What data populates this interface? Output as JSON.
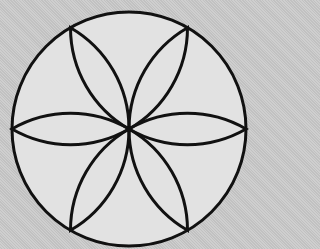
{
  "diagram": {
    "type": "six-petal rosette inscribed in circle",
    "canvas": {
      "width": 259,
      "height": 249
    },
    "circle": {
      "cx": 129,
      "cy": 129,
      "r": 117
    },
    "petal_count": 6,
    "petal_angles_deg": [
      0,
      60,
      120,
      180,
      240,
      300
    ],
    "petal_arc_radius": 117,
    "colors": {
      "background": "#c9c9c9",
      "circle_fill": "#e2e2e2",
      "stroke": "#111111"
    },
    "stroke_width": 3
  }
}
